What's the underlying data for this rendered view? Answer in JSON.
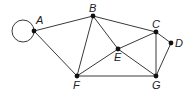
{
  "graph": {
    "nodes": [
      {
        "id": "A",
        "label": "A",
        "x": 34,
        "y": 31,
        "lx": 36,
        "ly": 24
      },
      {
        "id": "B",
        "label": "B",
        "x": 93,
        "y": 16,
        "lx": 89,
        "ly": 12
      },
      {
        "id": "C",
        "label": "C",
        "x": 156,
        "y": 32,
        "lx": 152,
        "ly": 28
      },
      {
        "id": "D",
        "label": "D",
        "x": 171,
        "y": 43,
        "lx": 175,
        "ly": 47
      },
      {
        "id": "E",
        "label": "E",
        "x": 118,
        "y": 49,
        "lx": 114,
        "ly": 61
      },
      {
        "id": "F",
        "label": "F",
        "x": 77,
        "y": 76,
        "lx": 73,
        "ly": 89
      },
      {
        "id": "G",
        "label": "G",
        "x": 156,
        "y": 76,
        "lx": 152,
        "ly": 89
      }
    ],
    "edges": [
      [
        "A",
        "B"
      ],
      [
        "A",
        "F"
      ],
      [
        "B",
        "F"
      ],
      [
        "B",
        "E"
      ],
      [
        "B",
        "C"
      ],
      [
        "C",
        "E"
      ],
      [
        "C",
        "G"
      ],
      [
        "C",
        "D"
      ],
      [
        "D",
        "G"
      ],
      [
        "E",
        "F"
      ],
      [
        "E",
        "G"
      ],
      [
        "F",
        "G"
      ]
    ],
    "loops": [
      {
        "node": "A",
        "cx": 23,
        "cy": 31,
        "r": 11
      }
    ]
  }
}
